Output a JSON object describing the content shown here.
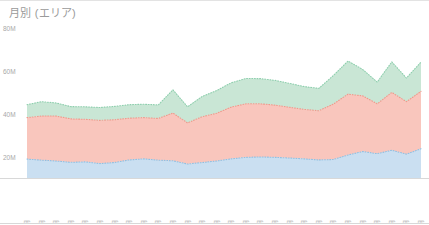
{
  "card": {
    "title": "月別 (エリア)"
  },
  "chart_data": {
    "type": "area",
    "stacked": true,
    "title": "月別 (エリア)",
    "xlabel": "",
    "ylabel": "",
    "ylim": [
      0,
      80000000
    ],
    "grid": false,
    "legend_position": "none",
    "ytick_labels": [
      "80M",
      "60M",
      "40M",
      "20M"
    ],
    "ytick_values": [
      80000000,
      60000000,
      40000000,
      20000000
    ],
    "categories": [
      "2016年4月",
      "2016年5月",
      "2016年6月",
      "2016年7月",
      "2016年8月",
      "2016年9月",
      "2016年10月",
      "2016年11月",
      "2016年12月",
      "2017年1月",
      "2017年2月",
      "2017年3月",
      "2017年4月",
      "2017年5月",
      "2017年6月",
      "2017年7月",
      "2017年8月",
      "2017年9月",
      "2017年10月",
      "2017年11月",
      "2017年12月",
      "2018年1月",
      "2018年2月",
      "2018年3月",
      "2018年4月",
      "2018年5月",
      "2018年6月",
      "2018年7月"
    ],
    "series": [
      {
        "name": "エリアA",
        "color": "#cadff1",
        "line_color": "#8fc0e3",
        "values": [
          19500000,
          19000000,
          18600000,
          18000000,
          18200000,
          17400000,
          17900000,
          19100000,
          19600000,
          19000000,
          18700000,
          17200000,
          17900000,
          18600000,
          19600000,
          20300000,
          20500000,
          20300000,
          20000000,
          19600000,
          19100000,
          19300000,
          21400000,
          23000000,
          22000000,
          23600000,
          21800000,
          24300000
        ]
      },
      {
        "name": "エリアB",
        "color": "#f9c6bd",
        "line_color": "#ef9a8c",
        "values": [
          19300000,
          20500000,
          20900000,
          20200000,
          19800000,
          20100000,
          19900000,
          19400000,
          19200000,
          19400000,
          22200000,
          19100000,
          21300000,
          22200000,
          24100000,
          24900000,
          24700000,
          24300000,
          23600000,
          23000000,
          22900000,
          25800000,
          28300000,
          25900000,
          23200000,
          26900000,
          24400000,
          26700000
        ]
      },
      {
        "name": "エリアC",
        "color": "#c9e6d5",
        "line_color": "#8fcfae",
        "values": [
          6000000,
          6700000,
          6100000,
          5700000,
          5800000,
          6000000,
          6200000,
          6300000,
          6200000,
          6300000,
          10800000,
          7500000,
          9400000,
          10600000,
          11300000,
          11800000,
          11700000,
          11500000,
          11100000,
          10600000,
          10400000,
          13300000,
          15400000,
          12300000,
          10100000,
          14200000,
          11000000,
          13600000
        ]
      }
    ]
  }
}
